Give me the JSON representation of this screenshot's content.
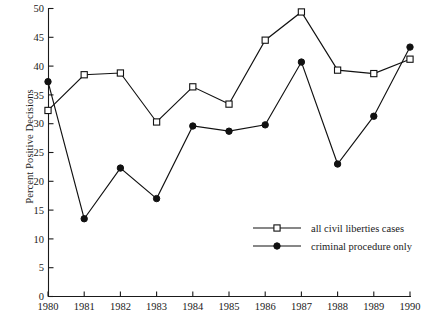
{
  "chart_data": {
    "type": "line",
    "title": "",
    "xlabel": "",
    "ylabel": "Percent Positive Decisions",
    "x": [
      1980,
      1981,
      1982,
      1983,
      1984,
      1985,
      1986,
      1987,
      1988,
      1989,
      1990
    ],
    "xtick_labels": [
      "1980",
      "1981",
      "1982",
      "1983",
      "1984",
      "1985",
      "1986",
      "1987",
      "1988",
      "1989",
      "1990"
    ],
    "ytick_labels": [
      "0",
      "5",
      "10",
      "15",
      "20",
      "25",
      "30",
      "35",
      "40",
      "45",
      "50"
    ],
    "ytick_values": [
      0,
      5,
      10,
      15,
      20,
      25,
      30,
      35,
      40,
      45,
      50
    ],
    "ylim": [
      0,
      50
    ],
    "xlim": [
      1980,
      1990
    ],
    "grid": false,
    "legend_position": "inside-lower-right",
    "series": [
      {
        "name": "all civil liberties cases",
        "marker": "open-square",
        "color": "#111111",
        "values": [
          32.3,
          38.5,
          38.8,
          30.3,
          36.4,
          33.4,
          44.5,
          49.4,
          39.3,
          38.7,
          41.2
        ]
      },
      {
        "name": "criminal procedure only",
        "marker": "filled-circle",
        "color": "#111111",
        "values": [
          37.3,
          13.5,
          22.3,
          17.0,
          29.6,
          28.7,
          29.8,
          40.7,
          23.0,
          31.3,
          43.3
        ]
      }
    ]
  },
  "legend": {
    "items": [
      {
        "label": "all civil liberties cases",
        "marker": "open-square"
      },
      {
        "label": "criminal procedure only",
        "marker": "filled-circle"
      }
    ]
  }
}
